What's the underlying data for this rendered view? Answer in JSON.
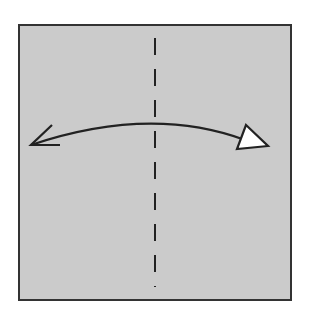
{
  "diagram": {
    "type": "origami-fold-step",
    "paper": {
      "fill": "#cbcbcb",
      "border": "#333333",
      "x": 19,
      "y": 25,
      "width": 272,
      "height": 275
    },
    "fold_line": {
      "kind": "valley-fold",
      "style": "dashed",
      "color": "#222222",
      "x": 155,
      "y1": 38,
      "y2": 287
    },
    "arrow": {
      "kind": "fold-and-unfold",
      "color": "#222222",
      "start": "open-arrowhead-left",
      "end": "hollow-triangle-right"
    }
  }
}
